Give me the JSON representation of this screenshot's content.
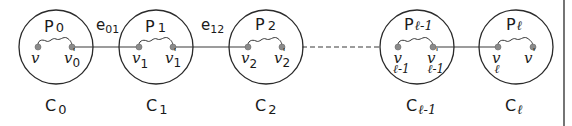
{
  "diagram": {
    "components": [
      {
        "id": "C0",
        "label": "C",
        "sub": "0",
        "path_label": "P",
        "path_sub": "0",
        "cx": 56,
        "v_in": "v",
        "v_in_sub": "",
        "v_out": "v",
        "v_out_sup": "'",
        "v_out_sub": "0"
      },
      {
        "id": "C1",
        "label": "C",
        "sub": "1",
        "path_label": "P",
        "path_sub": "1",
        "cx": 156,
        "v_in": "v",
        "v_in_sub": "1",
        "v_out": "v",
        "v_out_sup": "'",
        "v_out_sub": "1"
      },
      {
        "id": "C2",
        "label": "C",
        "sub": "2",
        "path_label": "P",
        "path_sub": "2",
        "cx": 266,
        "v_in": "v",
        "v_in_sub": "2",
        "v_out": "v",
        "v_out_sup": "'",
        "v_out_sub": "2"
      },
      {
        "id": "Cl-1",
        "label": "C",
        "sub": "ℓ-1",
        "path_label": "P",
        "path_sub": "ℓ-1",
        "cx": 417,
        "v_in": "v",
        "v_in_sub": "ℓ-1",
        "v_out": "v",
        "v_out_sup": "'",
        "v_out_sub": "ℓ-1"
      },
      {
        "id": "Cl",
        "label": "C",
        "sub": "ℓ",
        "path_label": "P",
        "path_sub": "ℓ",
        "cx": 516,
        "v_in": "v",
        "v_in_sub": "ℓ",
        "v_out": "v",
        "v_out_sup": "'",
        "v_out_sub": ""
      }
    ],
    "edges": [
      {
        "id": "e01",
        "label": "e",
        "sub": "01",
        "style": "solid"
      },
      {
        "id": "e12",
        "label": "e",
        "sub": "12",
        "style": "solid"
      },
      {
        "id": "e2-l-1",
        "label": "",
        "sub": "",
        "style": "dashed"
      },
      {
        "id": "el-1l",
        "label": "",
        "sub": "",
        "style": "solid"
      }
    ],
    "colors": {
      "stroke": "#2a2a2a",
      "vertex": "#8a8a8a",
      "background": "#ffffff"
    }
  }
}
